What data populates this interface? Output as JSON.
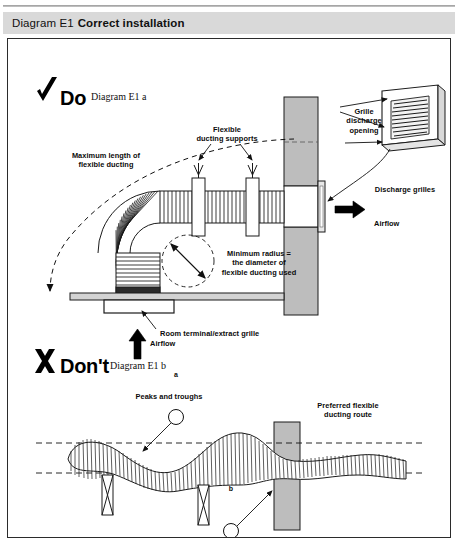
{
  "header": {
    "prefix": "Diagram E1",
    "title": "Correct installation"
  },
  "sections": {
    "do": {
      "mark": "check-mark",
      "word": "Do",
      "caption": "Diagram E1 a"
    },
    "dont": {
      "mark": "cross-mark",
      "word": "Don't",
      "caption": "Diagram E1 b"
    }
  },
  "labels": {
    "flexible_ducting_supports": "Flexible\nducting supports",
    "maximum_length": "Maximum length of\nflexible ducting",
    "grille_discharge_opening": "Grille\ndischarge\nopening",
    "discharge_grilles": "Discharge grilles",
    "airflow_horizontal": "Airflow",
    "airflow_vertical": "Airflow",
    "minimum_radius": "Minimum radius =\nthe diameter of\nflexible ducting used",
    "room_terminal": "Room terminal/extract grille",
    "peaks_and_troughs": "Peaks and troughs",
    "preferred_route": "Preferred flexible\nducting route",
    "restrictions": "Restrictions",
    "callout_a": "a",
    "callout_b": "b"
  },
  "colors": {
    "header_bg": "#d9d9d9",
    "panel_border": "#2b2b2b",
    "wall_fill": "#bdbdbd",
    "duct_stroke": "#111111",
    "ink": "#0b0b0b",
    "page_bg": "#ffffff"
  }
}
